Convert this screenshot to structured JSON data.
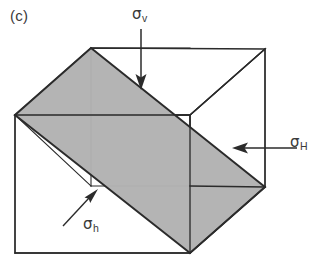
{
  "figure": {
    "panel_label": "(c)",
    "type": "3d-stress-block-diagram"
  },
  "colors": {
    "line": "#2b2b2b",
    "shaded_plane": "#b2b2b2",
    "shaded_plane_edge": "#2b2b2b",
    "background": "#ffffff",
    "text": "#3a3a3a"
  },
  "labels": {
    "sigma_v": {
      "symbol": "σ",
      "subscript": "v",
      "role": "vertical-stress"
    },
    "sigma_H": {
      "symbol": "σ",
      "subscript": "H",
      "role": "max-horizontal-stress"
    },
    "sigma_h": {
      "symbol": "σ",
      "subscript": "h",
      "role": "min-horizontal-stress"
    }
  },
  "geometry": {
    "cube_vertices": {
      "left_top": [
        15,
        115
      ],
      "left_bottom": [
        15,
        253
      ],
      "front_top": [
        91,
        48
      ],
      "back_bottom_hidden": [
        91,
        186
      ],
      "front_bottom": [
        190,
        253
      ],
      "right_front_top": [
        190,
        115
      ],
      "right_vertex": [
        265,
        187
      ],
      "right_top": [
        265,
        49
      ]
    },
    "shaded_plane": [
      [
        91,
        48
      ],
      [
        265,
        187
      ],
      [
        190,
        253
      ],
      [
        15,
        115
      ]
    ]
  },
  "arrows": {
    "sigma_v": {
      "from": [
        141,
        29
      ],
      "to": [
        141,
        88
      ],
      "direction": "down"
    },
    "sigma_H": {
      "from": [
        296,
        148
      ],
      "to": [
        233,
        148
      ],
      "direction": "left"
    },
    "sigma_h": {
      "from": [
        66,
        224
      ],
      "to": [
        97,
        191
      ],
      "direction": "up-right"
    }
  }
}
